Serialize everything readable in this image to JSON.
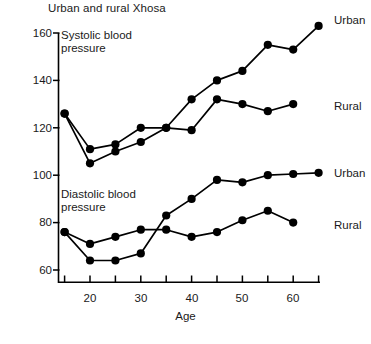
{
  "chart_data": {
    "type": "line",
    "title": "Urban and rural Xhosa",
    "xlabel": "Age",
    "ylabel": "",
    "xlim": [
      14.7,
      66
    ],
    "ylim": [
      58,
      165
    ],
    "xticks": [
      20,
      30,
      40,
      50,
      60
    ],
    "xtick_minor": [
      15,
      25,
      35,
      45,
      55,
      65
    ],
    "yticks": [
      60,
      80,
      100,
      120,
      140,
      160
    ],
    "grid": false,
    "legend_position": "right-inline",
    "panel_captions": [
      "Systolic blood\npressure",
      "Diastolic blood\npressure"
    ],
    "annotations": [
      {
        "text": "Urban",
        "series": "Systolic urban"
      },
      {
        "text": "Rural",
        "series": "Systolic rural"
      },
      {
        "text": "Urban",
        "series": "Diastolic urban"
      },
      {
        "text": "Rural",
        "series": "Diastolic rural"
      }
    ],
    "series": [
      {
        "name": "Systolic urban",
        "x": [
          15,
          20,
          25,
          30,
          35,
          40,
          45,
          50,
          55,
          60,
          65
        ],
        "values": [
          126,
          105,
          110,
          114,
          120,
          132,
          140,
          144,
          155,
          153,
          163
        ]
      },
      {
        "name": "Systolic rural",
        "x": [
          15,
          20,
          25,
          30,
          35,
          40,
          45,
          50,
          55,
          60
        ],
        "values": [
          126,
          111,
          113,
          120,
          120,
          119,
          132,
          130,
          127,
          130
        ]
      },
      {
        "name": "Diastolic urban",
        "x": [
          15,
          20,
          25,
          30,
          35,
          40,
          45,
          50,
          55,
          60,
          65
        ],
        "values": [
          76,
          64,
          64,
          67,
          83,
          90,
          98,
          97,
          100,
          100.5,
          101
        ]
      },
      {
        "name": "Diastolic rural",
        "x": [
          15,
          20,
          25,
          30,
          35,
          40,
          45,
          50,
          55,
          60
        ],
        "values": [
          76,
          71,
          74,
          77,
          77,
          74,
          76,
          81,
          85,
          80
        ]
      }
    ],
    "colors": {
      "line": "#000000",
      "marker": "#000000",
      "axis": "#000000",
      "text": "#1a1a1a",
      "background": "#ffffff"
    }
  },
  "labels": {
    "title": "Urban and rural Xhosa",
    "systolic_caption_line1": "Systolic blood",
    "systolic_caption_line2": "pressure",
    "diastolic_caption_line1": "Diastolic blood",
    "diastolic_caption_line2": "pressure",
    "urban_systolic": "Urban",
    "rural_systolic": "Rural",
    "urban_diastolic": "Urban",
    "rural_diastolic": "Rural",
    "x_axis_title": "Age",
    "ytick_160": "160",
    "ytick_140": "140",
    "ytick_120": "120",
    "ytick_100": "100",
    "ytick_80": "80",
    "ytick_60": "60",
    "xtick_20": "20",
    "xtick_30": "30",
    "xtick_40": "40",
    "xtick_50": "50",
    "xtick_60": "60"
  }
}
